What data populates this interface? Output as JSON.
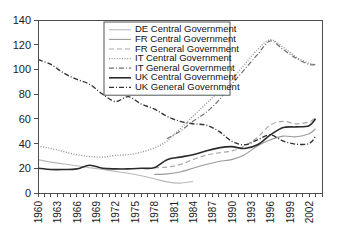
{
  "chart_data": {
    "type": "line",
    "title": "",
    "subtitle": "",
    "xlabel": "",
    "ylabel": "",
    "xlim": [
      1960,
      2004
    ],
    "ylim": [
      0,
      140
    ],
    "y_ticks": [
      0,
      20,
      40,
      60,
      80,
      100,
      120,
      140
    ],
    "x_ticks_labeled": [
      1960,
      1963,
      1966,
      1969,
      1972,
      1975,
      1978,
      1981,
      1984,
      1987,
      1990,
      1993,
      1996,
      1999,
      2002
    ],
    "x_tick_step_minor": 1,
    "grid": false,
    "legend_position": "top-right",
    "series": [
      {
        "name": "DE Central Government",
        "color": "#b9b9b9",
        "style": "solid",
        "width": 1.1,
        "x": [
          1960,
          1962,
          1964,
          1966,
          1968,
          1970,
          1972,
          1974,
          1976,
          1978,
          1980,
          1982,
          1984
        ],
        "values": [
          27.0,
          25.0,
          23.5,
          22.0,
          20.5,
          19.0,
          17.5,
          16.0,
          14.0,
          11.5,
          9.0,
          8.0,
          9.5
        ]
      },
      {
        "name": "FR Central Government",
        "color": "#9a9a9a",
        "style": "solid",
        "width": 1.1,
        "x": [
          1978,
          1980,
          1982,
          1984,
          1986,
          1988,
          1990,
          1992,
          1994,
          1996,
          1998,
          2000,
          2002,
          2003
        ],
        "values": [
          15.0,
          15.5,
          17.0,
          20.0,
          23.0,
          25.5,
          27.0,
          31.0,
          38.0,
          43.0,
          46.0,
          45.5,
          48.0,
          52.0
        ]
      },
      {
        "name": "FR General Government",
        "color": "#a8a8a8",
        "style": "dashed",
        "width": 1.2,
        "x": [
          1978,
          1980,
          1982,
          1984,
          1986,
          1988,
          1990,
          1992,
          1994,
          1996,
          1998,
          2000,
          2002,
          2003
        ],
        "values": [
          20.5,
          21.0,
          23.0,
          27.0,
          30.5,
          32.5,
          34.0,
          38.0,
          45.0,
          55.0,
          58.0,
          56.0,
          57.5,
          61.0
        ]
      },
      {
        "name": "IT Central Government",
        "color": "#8d8d8d",
        "style": "dotted",
        "width": 1.3,
        "x": [
          1960,
          1962,
          1964,
          1966,
          1968,
          1970,
          1972,
          1974,
          1976,
          1978,
          1980,
          1982,
          1984,
          1986,
          1988,
          1990,
          1992,
          1994,
          1996,
          1998,
          2000,
          2002,
          2003
        ],
        "values": [
          38.0,
          36.0,
          33.5,
          31.0,
          29.5,
          29.0,
          30.5,
          31.0,
          33.0,
          36.5,
          42.0,
          52.0,
          62.0,
          72.0,
          82.0,
          92.0,
          104.0,
          116.0,
          124.0,
          118.0,
          110.0,
          105.0,
          104.0
        ]
      },
      {
        "name": "IT General Government",
        "color": "#6f6f6f",
        "style": "dashdot",
        "width": 1.2,
        "x": [
          1980,
          1982,
          1984,
          1986,
          1988,
          1990,
          1992,
          1994,
          1996,
          1998,
          2000,
          2002,
          2003
        ],
        "values": [
          44.0,
          50.0,
          58.0,
          65.0,
          75.0,
          88.0,
          100.0,
          112.0,
          123.0,
          116.0,
          109.0,
          104.0,
          104.0
        ]
      },
      {
        "name": "UK Central Government",
        "color": "#2b2b2b",
        "style": "solid",
        "width": 1.6,
        "x": [
          1960,
          1962,
          1964,
          1966,
          1968,
          1970,
          1972,
          1974,
          1976,
          1978,
          1980,
          1982,
          1984,
          1986,
          1988,
          1990,
          1992,
          1994,
          1996,
          1998,
          2000,
          2002,
          2003
        ],
        "values": [
          20.0,
          19.0,
          19.0,
          19.5,
          22.5,
          20.0,
          19.5,
          19.5,
          20.0,
          20.5,
          27.0,
          29.0,
          31.0,
          34.0,
          36.5,
          37.5,
          36.0,
          39.0,
          47.0,
          53.0,
          53.5,
          54.5,
          60.0
        ]
      },
      {
        "name": "UK General Government",
        "color": "#333333",
        "style": "dashdot",
        "width": 1.4,
        "x": [
          1960,
          1962,
          1964,
          1966,
          1968,
          1970,
          1972,
          1974,
          1976,
          1978,
          1980,
          1982,
          1984,
          1986,
          1988,
          1990,
          1992,
          1994,
          1996,
          1998,
          2000,
          2002,
          2003
        ],
        "values": [
          108.0,
          104.0,
          97.0,
          92.0,
          88.0,
          80.0,
          74.0,
          78.0,
          72.0,
          68.0,
          62.0,
          58.0,
          56.0,
          55.0,
          50.0,
          42.0,
          39.0,
          43.0,
          47.0,
          42.0,
          39.5,
          40.0,
          46.0
        ]
      }
    ]
  },
  "axes": {
    "y_tick_labels": [
      "0",
      "20",
      "40",
      "60",
      "80",
      "100",
      "120",
      "140"
    ],
    "x_tick_labels": [
      "1960",
      "1963",
      "1966",
      "1969",
      "1972",
      "1975",
      "1978",
      "1981",
      "1984",
      "1987",
      "1990",
      "1993",
      "1996",
      "1999",
      "2002"
    ]
  },
  "legend": {
    "entries": [
      {
        "label": "DE Central Government"
      },
      {
        "label": "FR Central Government"
      },
      {
        "label": "FR General Government"
      },
      {
        "label": "IT Central Government"
      },
      {
        "label": "IT General Government"
      },
      {
        "label": "UK Central Government"
      },
      {
        "label": "UK General Government"
      }
    ]
  }
}
